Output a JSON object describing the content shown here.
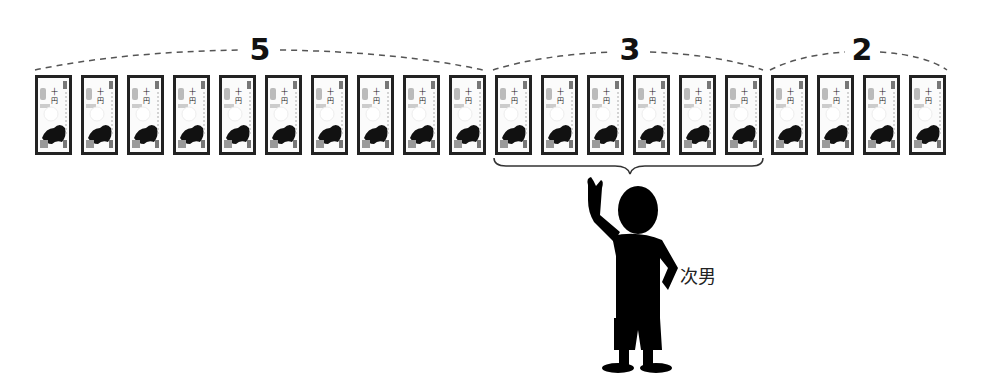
{
  "diagram": {
    "groups": [
      {
        "label": "5",
        "count": 10,
        "label_x": 260,
        "arc_from": 35,
        "arc_to": 483
      },
      {
        "label": "3",
        "count": 6,
        "label_x": 630,
        "arc_from": 493,
        "arc_to": 763
      },
      {
        "label": "2",
        "count": 4,
        "label_x": 862,
        "arc_from": 770,
        "arc_to": 947
      }
    ],
    "bill": {
      "icon": "ten-thousand-yen-bill-icon",
      "total": 20,
      "start_x": 35,
      "pitch": 46,
      "top": 75
    },
    "brace": {
      "from": 493,
      "to": 763,
      "target_group": "3"
    },
    "person": {
      "label": "次男",
      "icon": "person-silhouette-icon"
    }
  }
}
